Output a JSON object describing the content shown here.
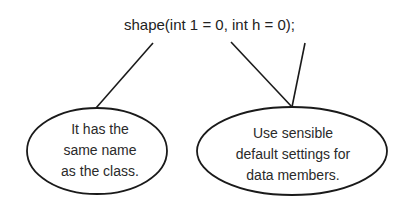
{
  "diagram": {
    "code_label": "shape(int 1 = 0, int h = 0);",
    "callouts": [
      {
        "lines": [
          "It has the",
          "same name",
          "as the class."
        ]
      },
      {
        "lines": [
          "Use sensible",
          "default settings for",
          "data members."
        ]
      }
    ],
    "colors": {
      "stroke": "#1a1a1a",
      "text": "#2a2a2a",
      "background": "#ffffff"
    }
  }
}
